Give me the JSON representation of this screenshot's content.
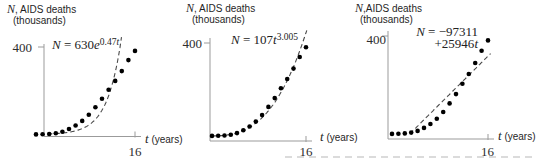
{
  "figure": {
    "background": "#ffffff",
    "axis_color": "#9b9b9b",
    "dot_color": "#000000",
    "curve_color": "#4a4a4a",
    "text_color": "#1f1f1f"
  },
  "chart_data": [
    {
      "type": "scatter",
      "name": "exponential-fit",
      "ylabel": {
        "var": "N",
        "rest": ", AIDS deaths",
        "unit": "(thousands)"
      },
      "xlabel": {
        "var": "t",
        "rest": " (years)"
      },
      "ytick": {
        "value": 400,
        "label": "400"
      },
      "xtick": {
        "value": 16,
        "label": "16"
      },
      "xlim": [
        0,
        17.5
      ],
      "ylim": [
        0,
        470
      ],
      "grid": false,
      "formula_text": "N = 630e^(0.47t)",
      "formula_lines": [
        {
          "base": "N = 630e",
          "sup": "0.47t"
        }
      ],
      "fit": {
        "type": "exponential",
        "a_thousands": 0.63,
        "b": 0.47,
        "t_draw_range": [
          2.8,
          14.0
        ],
        "dashed": true
      },
      "points": {
        "t": [
          1,
          2,
          3,
          4,
          5,
          6,
          7,
          8,
          9,
          10,
          11,
          12,
          13,
          14,
          15,
          16
        ],
        "N_thousands": [
          0.3,
          0.9,
          2.3,
          5.8,
          12.6,
          25,
          41,
          62,
          90,
          125,
          163,
          205,
          245,
          290,
          340,
          382
        ]
      }
    },
    {
      "type": "scatter",
      "name": "power-fit",
      "ylabel": {
        "var": "N",
        "rest": ", AIDS deaths",
        "unit": "(thousands)"
      },
      "xlabel": {
        "var": "t",
        "rest": " (years)"
      },
      "ytick": {
        "value": 400,
        "label": "400"
      },
      "xtick": {
        "value": 16,
        "label": "16"
      },
      "xlim": [
        0,
        17.5
      ],
      "ylim": [
        0,
        470
      ],
      "grid": false,
      "formula_text": "N = 107t^(3.005)",
      "formula_lines": [
        {
          "base": "N = 107t",
          "sup": "3.005"
        }
      ],
      "fit": {
        "type": "power",
        "a_thousands": 0.107,
        "b": 3.005,
        "t_draw_range": [
          1.0,
          16.15
        ],
        "dashed": true
      },
      "points": {
        "t": [
          1,
          2,
          3,
          4,
          5,
          6,
          7,
          8,
          9,
          10,
          11,
          12,
          13,
          14,
          15,
          16
        ],
        "N_thousands": [
          0.3,
          0.9,
          2.3,
          5.8,
          12.6,
          25,
          41,
          62,
          90,
          125,
          163,
          205,
          245,
          290,
          340,
          382
        ]
      }
    },
    {
      "type": "scatter",
      "name": "linear-fit",
      "ylabel": {
        "var": "N",
        "rest": ",AIDS deaths",
        "unit": "(thousands)"
      },
      "xlabel": {
        "var": "t",
        "rest": " (years)"
      },
      "ytick": {
        "value": 400,
        "label": "400"
      },
      "xtick": {
        "value": 16,
        "label": "16"
      },
      "xlim": [
        0,
        17.5
      ],
      "ylim": [
        0,
        470
      ],
      "grid": false,
      "formula_text": "N = −97311 + 25946t",
      "formula_lines": [
        {
          "base": "N = −97311"
        },
        {
          "base": "+25946t"
        }
      ],
      "fit": {
        "type": "linear",
        "slope_thousands": 25.946,
        "intercept_thousands": -97.311,
        "t_draw_range": [
          3.8,
          16.4
        ],
        "dashed": true
      },
      "points": {
        "t": [
          1,
          2,
          3,
          4,
          5,
          6,
          7,
          8,
          9,
          10,
          11,
          12,
          13,
          14,
          15,
          16
        ],
        "N_thousands": [
          0.3,
          0.9,
          2.3,
          5.8,
          12.6,
          25,
          41,
          62,
          90,
          125,
          163,
          205,
          245,
          290,
          340,
          382
        ]
      }
    }
  ]
}
